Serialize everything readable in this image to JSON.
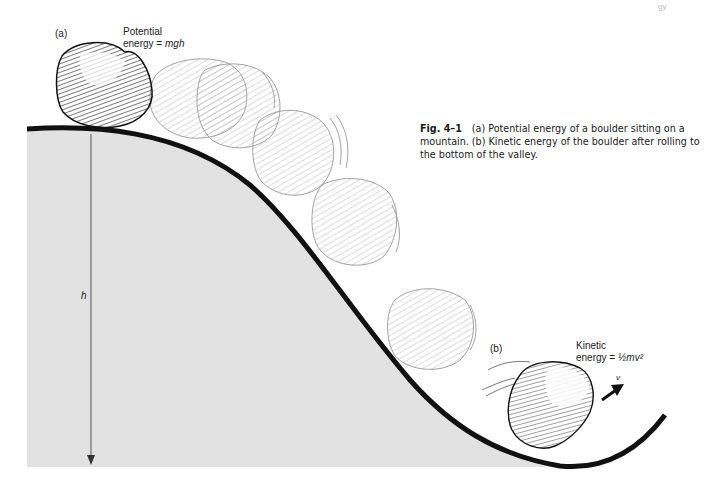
{
  "figure": {
    "label_a": "(a)",
    "label_b": "(b)",
    "potential": {
      "line1": "Potential",
      "line2_prefix": "energy = ",
      "line2_formula": "mgh"
    },
    "kinetic": {
      "line1": "Kinetic",
      "line2_prefix": "energy = ",
      "line2_formula": "½mv²"
    },
    "height_symbol": "h",
    "velocity_symbol": "v",
    "colors": {
      "ground_fill": "#e2e2e2",
      "curve": "#111111",
      "boulder_dark": "#222222",
      "boulder_ghost": "#9a9a9a"
    }
  },
  "caption": {
    "number": "Fig. 4–1",
    "text": "(a) Potential energy of a boulder sitting on a mountain. (b) Kinetic energy of the boulder after rolling to the bottom of the valley."
  },
  "page": {
    "corner_fragment": "gy"
  }
}
